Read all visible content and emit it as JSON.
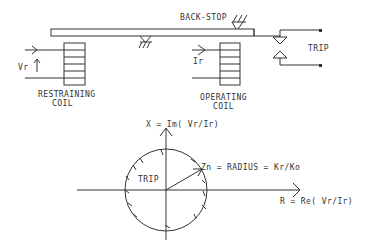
{
  "diagram": {
    "labels": {
      "back_stop": "BACK-STOP",
      "trip_contact": "TRIP",
      "vr": "Vr",
      "ir": "Ir",
      "restraining_coil_line1": "RESTRAINING",
      "restraining_coil_line2": "COIL",
      "operating_coil_line1": "OPERATING",
      "operating_coil_line2": "COIL",
      "x_axis": "X = Im( Vr/Ir)",
      "r_axis": "R = Re( Vr/Ir)",
      "radius": "Zn = RADIUS = Kr/Ko",
      "trip_region": "TRIP"
    },
    "colors": {
      "line": "#333333",
      "background": "#ffffff"
    }
  }
}
